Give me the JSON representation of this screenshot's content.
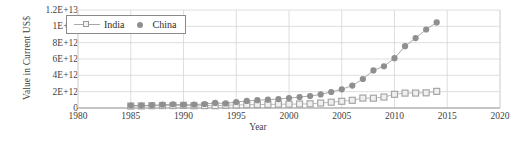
{
  "chart_data": {
    "type": "scatter",
    "title": "",
    "xlabel": "Year",
    "ylabel": "Value in Current US$",
    "xlim": [
      1980,
      2020
    ],
    "ylim": [
      0,
      12000000000000
    ],
    "grid": true,
    "legend_position": "top-left-inside",
    "x_ticks": [
      "1980",
      "1985",
      "1990",
      "1995",
      "2000",
      "2005",
      "2010",
      "2015",
      "2020"
    ],
    "x_tick_values": [
      1980,
      1985,
      1990,
      1995,
      2000,
      2005,
      2010,
      2015,
      2020
    ],
    "y_ticks": [
      "0",
      "2E+12",
      "4E+12",
      "6E+12",
      "8E+12",
      "1E+13",
      "1.2E+13"
    ],
    "y_tick_values": [
      0,
      2000000000000,
      4000000000000,
      6000000000000,
      8000000000000,
      10000000000000,
      12000000000000
    ],
    "x": [
      1985,
      1986,
      1987,
      1988,
      1989,
      1990,
      1991,
      1992,
      1993,
      1994,
      1995,
      1996,
      1997,
      1998,
      1999,
      2000,
      2001,
      2002,
      2003,
      2004,
      2005,
      2006,
      2007,
      2008,
      2009,
      2010,
      2011,
      2012,
      2013,
      2014
    ],
    "series": [
      {
        "name": "India",
        "marker": "open-square",
        "color": "#a6a6a6",
        "values": [
          237000000000.0,
          255000000000.0,
          283000000000.0,
          297000000000.0,
          301000000000.0,
          327000000000.0,
          275000000000.0,
          293000000000.0,
          284000000000.0,
          333000000000.0,
          367000000000.0,
          400000000000.0,
          423000000000.0,
          429000000000.0,
          466000000000.0,
          468000000000.0,
          485000000000.0,
          515000000000.0,
          608000000000.0,
          709000000000.0,
          820000000000.0,
          940000000000.0,
          1217000000000.0,
          1199000000000.0,
          1342000000000.0,
          1676000000000.0,
          1823000000000.0,
          1828000000000.0,
          1857000000000.0,
          2039000000000.0
        ]
      },
      {
        "name": "China",
        "marker": "filled-circle",
        "color": "#8f8f8f",
        "values": [
          309000000000.0,
          300000000000.0,
          327000000000.0,
          409000000000.0,
          459000000000.0,
          399000000000.0,
          413000000000.0,
          492000000000.0,
          617000000000.0,
          563000000000.0,
          734000000000.0,
          863000000000.0,
          962000000000.0,
          1020000000000.0,
          1090000000000.0,
          1210000000000.0,
          1340000000000.0,
          1470000000000.0,
          1660000000000.0,
          1960000000000.0,
          2290000000000.0,
          2750000000000.0,
          3550000000000.0,
          4600000000000.0,
          5110000000000.0,
          6100000000000.0,
          7570000000000.0,
          8560000000000.0,
          9610000000000.0,
          10480000000000.0
        ]
      }
    ],
    "legend": [
      {
        "label": "India",
        "marker": "open-square"
      },
      {
        "label": "China",
        "marker": "filled-circle"
      }
    ]
  }
}
